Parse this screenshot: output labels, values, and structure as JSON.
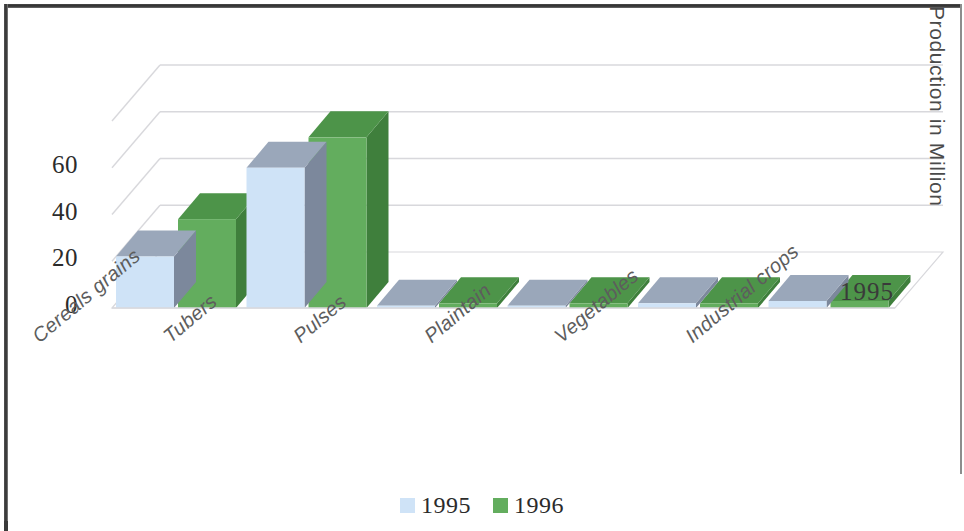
{
  "chart_data": {
    "type": "bar",
    "title": "",
    "subtitle": "",
    "xlabel": "",
    "ylabel": "Production in Million",
    "zlabel": "1995",
    "categories": [
      "Cereals grains",
      "Tubers",
      "Pulses",
      "Plaintain",
      "Vegetables",
      "Industrial crops"
    ],
    "series": [
      {
        "name": "1995",
        "color": "#cfe3f7",
        "values": [
          22,
          60,
          1,
          1,
          2,
          3
        ]
      },
      {
        "name": "1996",
        "color": "#63ad5e",
        "values": [
          38,
          73,
          2,
          2,
          2,
          3
        ]
      }
    ],
    "ylim": [
      0,
      80
    ],
    "yticks": [
      0,
      20,
      40,
      60
    ],
    "ytick_labels": [
      "0",
      "20",
      "40",
      "60"
    ],
    "grid": true,
    "gridlines_at": [
      20,
      40,
      60,
      80
    ],
    "legend_position": "bottom",
    "projection": "3d",
    "style": "clustered-3d-column"
  },
  "axis": {
    "y_title": "Production in Million",
    "z_tick": "1995",
    "tick_labels": [
      "60",
      "40",
      "20",
      "0"
    ]
  },
  "legend": {
    "entries": [
      {
        "label": "1995",
        "color": "#cfe3f7"
      },
      {
        "label": "1996",
        "color": "#63ad5e"
      }
    ]
  },
  "colors": {
    "series_1995_front": "#cfe3f7",
    "series_1995_side": "#7c889c",
    "series_1995_top": "#9aa7ba",
    "series_1996_front": "#63ad5e",
    "series_1996_side": "#3f7f3c",
    "series_1996_top": "#4d9449",
    "gridline": "#d8d8dc",
    "floor": "#ffffff",
    "text": "#2b2b2b",
    "category_text": "#5d5d5d",
    "frame": "#2f2f2f"
  }
}
